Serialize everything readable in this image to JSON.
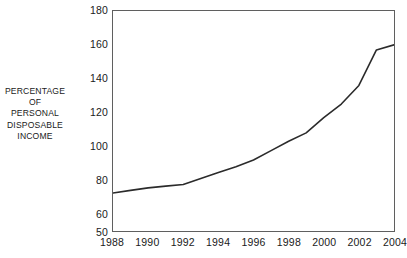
{
  "chart_data": {
    "type": "line",
    "title": "",
    "subtitle": "",
    "xlabel": "",
    "ylabel": "PERCENTAGE OF PERSONAL DISPOSABLE INCOME",
    "ylabel_lines": [
      "PERCENTAGE",
      "OF",
      "PERSONAL",
      "DISPOSABLE",
      "INCOME"
    ],
    "xlim": [
      1988,
      2004
    ],
    "ylim": [
      50,
      180
    ],
    "grid": false,
    "legend": null,
    "legend_position": "none",
    "frame": "full-box",
    "line_color": "#2b2b2b",
    "line_width": 1.6,
    "xticks": [
      1988,
      1990,
      1992,
      1994,
      1996,
      1998,
      2000,
      2002,
      2004
    ],
    "xtick_labels": [
      "1988",
      "1990",
      "1992",
      "1994",
      "1996",
      "1998",
      "2000",
      "2002",
      "2004"
    ],
    "yticks": [
      50,
      60,
      80,
      100,
      120,
      140,
      160,
      180
    ],
    "ytick_labels": [
      "50",
      "60",
      "80",
      "100",
      "120",
      "140",
      "160",
      "180"
    ],
    "series": [
      {
        "name": "Percentage of personal disposable income",
        "x": [
          1988,
          1989,
          1990,
          1991,
          1992,
          1993,
          1994,
          1995,
          1996,
          1997,
          1998,
          1999,
          2000,
          2001,
          2002,
          2003,
          2004
        ],
        "values": [
          72.5,
          74,
          75.5,
          76.5,
          77.5,
          81,
          84.5,
          88,
          92,
          97.5,
          103,
          108,
          117,
          125,
          136,
          157,
          160
        ]
      }
    ]
  },
  "axis": {
    "y_title_lines": [
      "PERCENTAGE",
      "OF",
      "PERSONAL",
      "DISPOSABLE",
      "INCOME"
    ]
  }
}
